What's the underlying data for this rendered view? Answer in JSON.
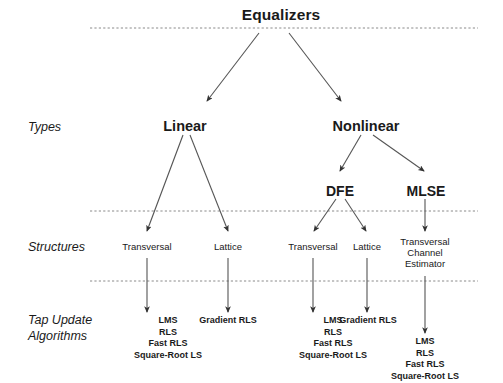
{
  "diagram": {
    "title": "Equalizers",
    "row_labels": [
      {
        "id": "types",
        "text": "Types",
        "x": 28,
        "y": 120
      },
      {
        "id": "structures",
        "text": "Structures",
        "x": 28,
        "y": 240
      },
      {
        "id": "tap-update-algorithms",
        "line1": "Tap Update",
        "line2": "Algorithms",
        "x": 28,
        "y": 313
      }
    ],
    "root": {
      "label": "Equalizers",
      "x": 281,
      "y": 6
    },
    "types": [
      {
        "id": "linear",
        "label": "Linear",
        "x": 185,
        "y": 118
      },
      {
        "id": "nonlinear",
        "label": "Nonlinear",
        "x": 366,
        "y": 118
      }
    ],
    "subtypes": [
      {
        "id": "dfe",
        "label": "DFE",
        "x": 340,
        "y": 183
      },
      {
        "id": "mlse",
        "label": "MLSE",
        "x": 426,
        "y": 183
      }
    ],
    "structures": [
      {
        "id": "linear-transversal",
        "label": "Transversal",
        "x": 147,
        "y": 241
      },
      {
        "id": "linear-lattice",
        "label": "Lattice",
        "x": 228,
        "y": 241
      },
      {
        "id": "dfe-transversal",
        "label": "Transversal",
        "x": 313,
        "y": 241
      },
      {
        "id": "dfe-lattice",
        "label": "Lattice",
        "x": 367,
        "y": 241
      },
      {
        "id": "mlse-structure",
        "label": "Transversal\nChannel\nEstimator",
        "lines": [
          "Transversal",
          "Channel",
          "Estimator"
        ],
        "x": 425,
        "y": 241
      }
    ],
    "algorithms": [
      {
        "id": "linear-transversal-algorithms",
        "lines": [
          "LMS",
          "RLS",
          "Fast RLS",
          "Square-Root LS"
        ],
        "x": 168,
        "y": 315
      },
      {
        "id": "linear-lattice-algorithms",
        "lines": [
          "Gradient RLS"
        ],
        "x": 228,
        "y": 315
      },
      {
        "id": "dfe-transversal-algorithms",
        "lines": [
          "LMS",
          "RLS",
          "Fast RLS",
          "Square-Root LS"
        ],
        "x": 333,
        "y": 315
      },
      {
        "id": "dfe-lattice-algorithms",
        "lines": [
          "Gradient RLS"
        ],
        "x": 368,
        "y": 315
      },
      {
        "id": "mlse-algorithms",
        "lines": [
          "LMS",
          "RLS",
          "Fast RLS",
          "Square-Root LS"
        ],
        "x": 425,
        "y": 336
      }
    ],
    "colors": {
      "background": "#ffffff",
      "text": "#1a1a1a",
      "line": "#5a5a5a",
      "divider": "#8a8a8a"
    },
    "dividers": [
      {
        "id": "divider-top",
        "y": 28,
        "x1": 90,
        "x2": 478
      },
      {
        "id": "divider-middle",
        "y": 211,
        "x1": 90,
        "x2": 478
      },
      {
        "id": "divider-bottom",
        "y": 281,
        "x1": 90,
        "x2": 478
      }
    ]
  }
}
